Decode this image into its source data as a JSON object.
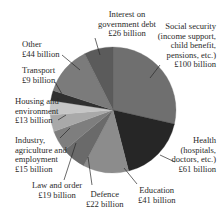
{
  "chart_data": {
    "type": "pie",
    "title": "",
    "unit": "£ billion",
    "start_angle_deg": 0,
    "direction": "clockwise",
    "total": 350,
    "slices": [
      {
        "name": "Social security (income support, child benefit, pensions, etc.)",
        "value": 100,
        "color": "#6f6f6f"
      },
      {
        "name": "Health (hospitals, doctors, etc.)",
        "value": 61,
        "color": "#262626"
      },
      {
        "name": "Education",
        "value": 41,
        "color": "#8c8c8c"
      },
      {
        "name": "Defence",
        "value": 22,
        "color": "#6a6a6a"
      },
      {
        "name": "Law and order",
        "value": 19,
        "color": "#7e7e7e"
      },
      {
        "name": "Industry, agriculture and employment",
        "value": 15,
        "color": "#a9a9a9"
      },
      {
        "name": "Housing and environment",
        "value": 13,
        "color": "#c6c6c6"
      },
      {
        "name": "Transport",
        "value": 9,
        "color": "#303030"
      },
      {
        "name": "Other",
        "value": 44,
        "color": "#7b7b7b"
      },
      {
        "name": "Interest on government debt",
        "value": 26,
        "color": "#5b5b5b"
      }
    ]
  },
  "labels": {
    "social": [
      "Social security",
      "(income support,",
      "child benefit,",
      "pensions, etc.)",
      "£100 billion"
    ],
    "health": [
      "Health",
      "(hospitals,",
      "doctors, etc.)",
      "£61 billion"
    ],
    "education": [
      "Education",
      "£41 billion"
    ],
    "defence": [
      "Defence",
      "£22 billion"
    ],
    "law": [
      "Law and order",
      "£19 billion"
    ],
    "industry": [
      "Industry,",
      "agriculture and",
      "employment",
      "£15 billion"
    ],
    "housing": [
      "Housing and",
      "environment",
      "£13 billion"
    ],
    "transport": [
      "Transport",
      "£9 billion"
    ],
    "other": [
      "Other",
      "£44 billion"
    ],
    "interest": [
      "Interest on",
      "government debt",
      "£26 billion"
    ]
  }
}
